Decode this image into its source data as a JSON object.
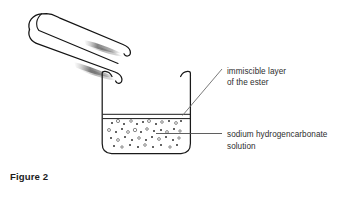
{
  "figure": {
    "caption": "Figure 2",
    "background_color": "#ffffff",
    "ink_color": "#1c1c1c",
    "text_color": "#2e2e2e",
    "shading_color": "#6e6e6e"
  },
  "labels": {
    "immiscible": {
      "line1": "immiscible layer",
      "line2": "of the ester"
    },
    "bicarbonate": {
      "line1": "sodium hydrogencarbonate",
      "line2": "solution"
    }
  },
  "apparatus": {
    "tongs": {
      "name": "test-tube-tongs",
      "description": "hairpin tongs angled from upper-left down to lower-right with hooked tips"
    },
    "beaker": {
      "name": "beaker",
      "description": "open beaker with flared rim, rounded base, liquid with bubbles and thin immiscible ester layer on top"
    }
  },
  "leader_lines": {
    "immiscible": "diagonal from label down-left to the ester layer at the beaker rim",
    "bicarbonate": "horizontal from label left into the solution"
  },
  "bubbles": [
    {
      "x": 112,
      "y": 123,
      "r": 1.0,
      "filled": true
    },
    {
      "x": 118,
      "y": 121,
      "r": 1.6,
      "filled": false
    },
    {
      "x": 124,
      "y": 124,
      "r": 1.0,
      "filled": true
    },
    {
      "x": 131,
      "y": 121,
      "r": 1.3,
      "filled": false
    },
    {
      "x": 137,
      "y": 124,
      "r": 1.0,
      "filled": true
    },
    {
      "x": 143,
      "y": 122,
      "r": 1.0,
      "filled": true
    },
    {
      "x": 149,
      "y": 121,
      "r": 1.5,
      "filled": false
    },
    {
      "x": 156,
      "y": 124,
      "r": 1.0,
      "filled": true
    },
    {
      "x": 162,
      "y": 122,
      "r": 1.3,
      "filled": false
    },
    {
      "x": 169,
      "y": 121,
      "r": 1.0,
      "filled": true
    },
    {
      "x": 176,
      "y": 123,
      "r": 1.4,
      "filled": false
    },
    {
      "x": 181,
      "y": 121,
      "r": 1.0,
      "filled": true
    },
    {
      "x": 109,
      "y": 130,
      "r": 1.5,
      "filled": false
    },
    {
      "x": 116,
      "y": 132,
      "r": 1.0,
      "filled": true
    },
    {
      "x": 122,
      "y": 129,
      "r": 1.0,
      "filled": true
    },
    {
      "x": 128,
      "y": 132,
      "r": 1.4,
      "filled": false
    },
    {
      "x": 135,
      "y": 130,
      "r": 1.7,
      "filled": false
    },
    {
      "x": 141,
      "y": 132,
      "r": 1.0,
      "filled": true
    },
    {
      "x": 147,
      "y": 129,
      "r": 1.3,
      "filled": false
    },
    {
      "x": 154,
      "y": 131,
      "r": 1.0,
      "filled": true
    },
    {
      "x": 161,
      "y": 130,
      "r": 1.0,
      "filled": true
    },
    {
      "x": 167,
      "y": 132,
      "r": 1.4,
      "filled": false
    },
    {
      "x": 174,
      "y": 129,
      "r": 1.0,
      "filled": true
    },
    {
      "x": 180,
      "y": 131,
      "r": 1.2,
      "filled": false
    },
    {
      "x": 111,
      "y": 138,
      "r": 1.0,
      "filled": true
    },
    {
      "x": 118,
      "y": 140,
      "r": 1.4,
      "filled": false
    },
    {
      "x": 125,
      "y": 137,
      "r": 1.0,
      "filled": true
    },
    {
      "x": 132,
      "y": 140,
      "r": 1.0,
      "filled": true
    },
    {
      "x": 139,
      "y": 138,
      "r": 1.3,
      "filled": false
    },
    {
      "x": 146,
      "y": 140,
      "r": 1.0,
      "filled": true
    },
    {
      "x": 152,
      "y": 137,
      "r": 1.0,
      "filled": true
    },
    {
      "x": 159,
      "y": 139,
      "r": 1.4,
      "filled": false
    },
    {
      "x": 166,
      "y": 137,
      "r": 1.0,
      "filled": true
    },
    {
      "x": 173,
      "y": 140,
      "r": 1.0,
      "filled": true
    },
    {
      "x": 179,
      "y": 138,
      "r": 1.2,
      "filled": false
    },
    {
      "x": 114,
      "y": 146,
      "r": 1.0,
      "filled": true
    },
    {
      "x": 122,
      "y": 147,
      "r": 1.2,
      "filled": false
    },
    {
      "x": 130,
      "y": 145,
      "r": 1.0,
      "filled": true
    },
    {
      "x": 138,
      "y": 147,
      "r": 1.0,
      "filled": true
    },
    {
      "x": 145,
      "y": 145,
      "r": 1.3,
      "filled": false
    },
    {
      "x": 153,
      "y": 147,
      "r": 1.0,
      "filled": true
    },
    {
      "x": 161,
      "y": 145,
      "r": 1.0,
      "filled": true
    },
    {
      "x": 170,
      "y": 147,
      "r": 1.2,
      "filled": false
    },
    {
      "x": 177,
      "y": 145,
      "r": 1.0,
      "filled": true
    }
  ]
}
